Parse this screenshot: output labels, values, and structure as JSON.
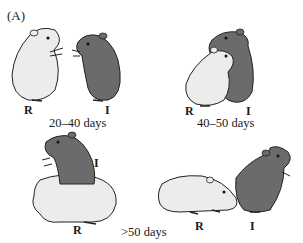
{
  "figure": {
    "panel_label": "(A)",
    "colors": {
      "resident_fill": "#ececec",
      "intruder_fill": "#6b6b6b",
      "outline": "#222222",
      "background": "#ffffff"
    },
    "scenes": [
      {
        "id": "scene-1",
        "age_label": "20–40 days",
        "description": "Resident and intruder standing upright facing each other",
        "labels": {
          "resident": "R",
          "intruder": "I"
        }
      },
      {
        "id": "scene-2",
        "age_label": "40–50 days",
        "description": "Resident and intruder standing upright, embracing / wrestling",
        "labels": {
          "resident": "R",
          "intruder": "I"
        }
      },
      {
        "id": "scene-3",
        "age_label": ">50 days",
        "description": "Intruder climbing on top of crouching resident",
        "labels": {
          "resident": "R",
          "intruder": "I"
        }
      },
      {
        "id": "scene-4",
        "age_label": "",
        "description": "Resident on all fours approaching intruder's flank; intruder upright facing away",
        "labels": {
          "resident": "R",
          "intruder": "I"
        }
      }
    ]
  }
}
